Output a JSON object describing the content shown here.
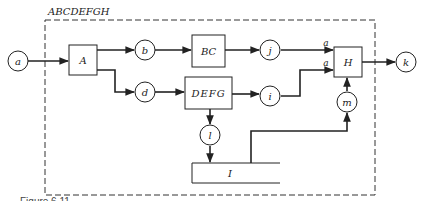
{
  "diagram": {
    "group_label": "ABCDEFGH",
    "caption_partial": "Figure 6.11",
    "colors": {
      "stroke": "#222222",
      "background": "#ffffff"
    },
    "nodes": {
      "a": "a",
      "b": "b",
      "d": "d",
      "j": "j",
      "i": "i",
      "k": "k",
      "l": "l",
      "m": "m"
    },
    "blocks": {
      "A": "A",
      "BC": "BC",
      "DEFG": "DEFG",
      "H": "H",
      "I": "I"
    },
    "input_labels": {
      "h_in_top": "a",
      "h_in_bottom": "a"
    },
    "edges": [
      [
        "a",
        "A"
      ],
      [
        "A",
        "b"
      ],
      [
        "A",
        "d"
      ],
      [
        "b",
        "BC"
      ],
      [
        "BC",
        "j"
      ],
      [
        "d",
        "DEFG"
      ],
      [
        "DEFG",
        "i"
      ],
      [
        "DEFG",
        "l"
      ],
      [
        "l",
        "I"
      ],
      [
        "j",
        "H"
      ],
      [
        "i",
        "H"
      ],
      [
        "I",
        "m"
      ],
      [
        "m",
        "H"
      ],
      [
        "H",
        "k"
      ]
    ]
  }
}
